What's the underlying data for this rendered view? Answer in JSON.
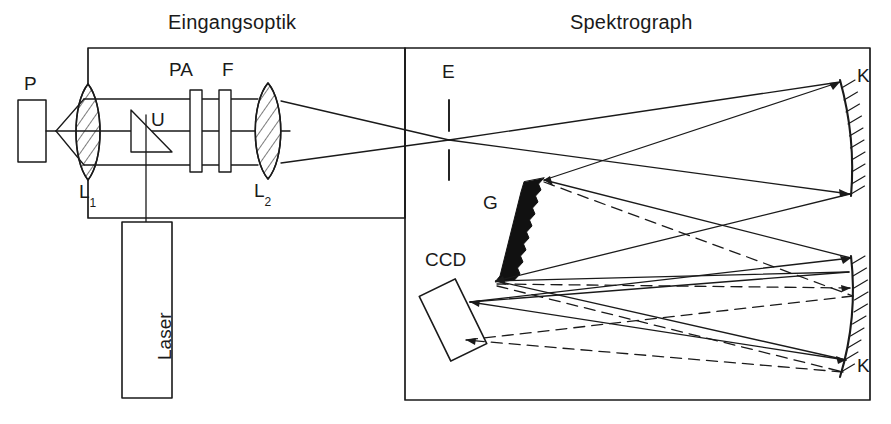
{
  "figure": {
    "width": 891,
    "height": 424,
    "background": "#ffffff",
    "line_color": "#1a1a1a",
    "text_color": "#1a1a1a"
  },
  "titles": {
    "input_optics": "Eingangsoptik",
    "spectrograph": "Spektrograph"
  },
  "labels": {
    "sample": "P",
    "lens1_main": "L",
    "lens1_sub": "1",
    "beamsplitter": "U",
    "polarizer": "PA",
    "filter": "F",
    "lens2_main": "L",
    "lens2_sub": "2",
    "laser": "Laser",
    "entrance_slit": "E",
    "grating": "G",
    "mirror_top": "K",
    "mirror_bottom": "K",
    "detector": "CCD"
  },
  "components": {
    "sample_block": {
      "name": "P",
      "x": 18,
      "y": 100,
      "w": 28,
      "h": 62
    },
    "lens_1": {
      "name": "L1",
      "cx": 88,
      "cy": 132,
      "half_w": 16,
      "half_h": 48,
      "hatched": true
    },
    "beamsplitter_prism": {
      "name": "U",
      "type": "right-triangle"
    },
    "polarizer_plate": {
      "name": "PA",
      "x": 190,
      "y": 90,
      "w": 12,
      "h": 82
    },
    "filter_plate": {
      "name": "F",
      "x": 219,
      "y": 90,
      "w": 12,
      "h": 82
    },
    "lens_2": {
      "name": "L2",
      "cx": 268,
      "cy": 131,
      "half_w": 16,
      "half_h": 48,
      "hatched": true
    },
    "laser_box": {
      "name": "Laser",
      "x": 122,
      "y": 222,
      "w": 50,
      "h": 176
    },
    "slit_E": {
      "name": "E",
      "x": 449,
      "y_top": 100,
      "y_bottom": 180
    },
    "grating_G": {
      "name": "G",
      "type": "blazed-sawtooth",
      "x1": 544,
      "y1": 178,
      "x2": 495,
      "y2": 282
    },
    "mirror_K_top": {
      "name": "K",
      "type": "concave",
      "x1": 840,
      "y1": 80,
      "x2": 851,
      "y2": 196
    },
    "mirror_K_bottom": {
      "name": "K",
      "type": "concave",
      "x1": 851,
      "y1": 256,
      "x2": 840,
      "y2": 377
    },
    "ccd_detector": {
      "name": "CCD",
      "type": "tilted-rectangle",
      "cx": 453,
      "cy": 320,
      "w": 40,
      "h": 72,
      "rotation_deg": -26
    }
  },
  "enclosures": {
    "input_optics_box": {
      "x": 88,
      "y": 48,
      "w": 317,
      "h": 170
    },
    "spectrograph_box": {
      "x": 405,
      "y": 48,
      "w": 465,
      "h": 352
    }
  },
  "beams": {
    "solid_style": {
      "stroke_width": 1.3,
      "dash": "none"
    },
    "dashed_style": {
      "stroke_width": 1.3,
      "dash": "11 7"
    }
  }
}
